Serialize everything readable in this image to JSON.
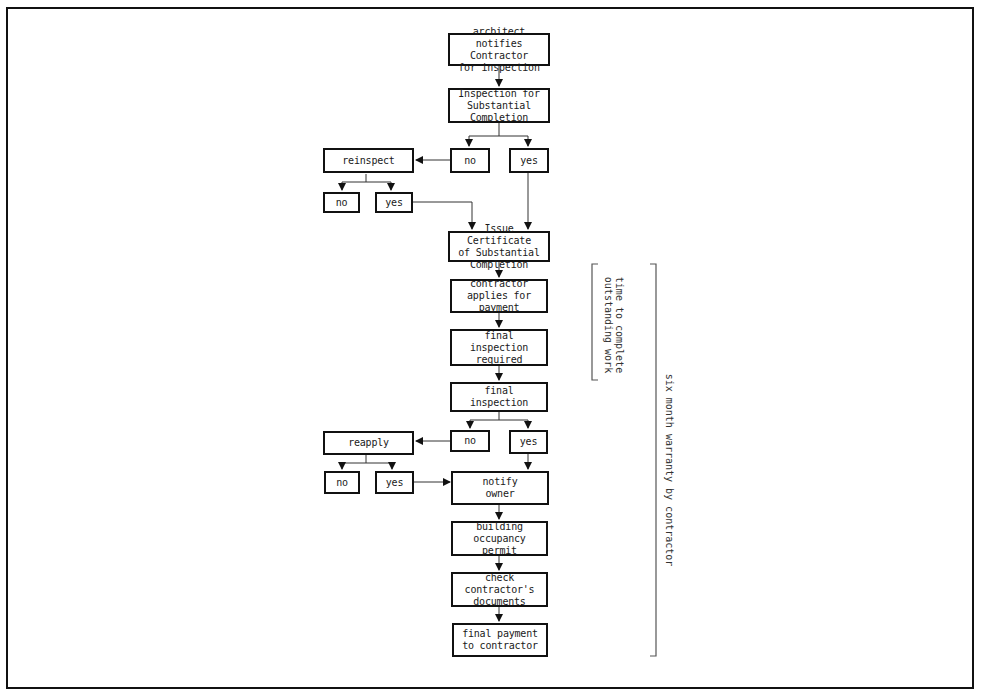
{
  "diagram": {
    "type": "flowchart",
    "nodes": {
      "architect_notifies": "arcbitect notifies\nContractor\nfor inspection",
      "inspection_substantial": "Inspection for\nSubstantial\nCompletion",
      "decision1_no": "no",
      "decision1_yes": "yes",
      "reinspect": "reinspect",
      "reinspect_no": "no",
      "reinspect_yes": "yes",
      "issue_certificate": "Issue Certificate\nof Substantial\nCompletion",
      "contractor_applies": "contractor\napplies for\npayment",
      "final_inspection_required": "final inspection\nrequired",
      "final_inspection": "final inspection",
      "decision2_no": "no",
      "decision2_yes": "yes",
      "reapply": "reapply",
      "reapply_no": "no",
      "reapply_yes": "yes",
      "notify_owner": "notify\nowner",
      "building_permit": "building\noccupancy\npermit",
      "check_documents": "check\ncontractor's\ndocuments",
      "final_payment": "final payment\nto contractor"
    },
    "edges": [
      [
        "architect_notifies",
        "inspection_substantial"
      ],
      [
        "inspection_substantial",
        "decision1_no"
      ],
      [
        "inspection_substantial",
        "decision1_yes"
      ],
      [
        "decision1_no",
        "reinspect"
      ],
      [
        "reinspect",
        "reinspect_no"
      ],
      [
        "reinspect",
        "reinspect_yes"
      ],
      [
        "reinspect_yes",
        "issue_certificate"
      ],
      [
        "decision1_yes",
        "issue_certificate"
      ],
      [
        "issue_certificate",
        "contractor_applies"
      ],
      [
        "contractor_applies",
        "final_inspection_required"
      ],
      [
        "final_inspection_required",
        "final_inspection"
      ],
      [
        "final_inspection",
        "decision2_no"
      ],
      [
        "final_inspection",
        "decision2_yes"
      ],
      [
        "decision2_no",
        "reapply"
      ],
      [
        "reapply",
        "reapply_no"
      ],
      [
        "reapply",
        "reapply_yes"
      ],
      [
        "reapply_yes",
        "notify_owner"
      ],
      [
        "decision2_yes",
        "notify_owner"
      ],
      [
        "notify_owner",
        "building_permit"
      ],
      [
        "building_permit",
        "check_documents"
      ],
      [
        "check_documents",
        "final_payment"
      ]
    ],
    "brackets": {
      "outstanding_work": "time to complete\noutstanding work",
      "warranty": "six month warranty by contractor"
    },
    "colors": {
      "line": "#111111",
      "bracket": "#555555",
      "background": "#ffffff"
    }
  }
}
